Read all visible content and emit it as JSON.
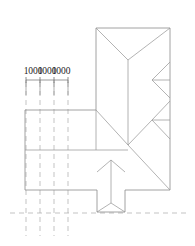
{
  "drawing": {
    "type": "architectural-roof-plan",
    "title": "",
    "background_color": "#ffffff",
    "line_color": "#8c8c8c",
    "dim_line_color": "#6e6e6e",
    "dash_line_color": "#a9a9a9",
    "text_color": "#1c1c1c",
    "canvas": {
      "width": 195,
      "height": 246
    },
    "dimensions": {
      "labels": [
        "1000",
        "1000",
        "1000"
      ],
      "label_positions": [
        {
          "x": 33,
          "y": 74
        },
        {
          "x": 47,
          "y": 74
        },
        {
          "x": 61,
          "y": 74
        }
      ],
      "dim_line": {
        "x1": 26,
        "y1": 80,
        "x2": 68,
        "y2": 80
      },
      "ticks": [
        26,
        40,
        54,
        68
      ],
      "tick_half": 3,
      "extension_lines": [
        {
          "x": 26,
          "y1": 80,
          "y2": 95
        },
        {
          "x": 40,
          "y1": 80,
          "y2": 95
        },
        {
          "x": 54,
          "y1": 80,
          "y2": 95
        },
        {
          "x": 68,
          "y1": 80,
          "y2": 95
        }
      ]
    },
    "grid_lines": {
      "vertical": [
        {
          "x": 26,
          "y1": 82,
          "y2": 236
        },
        {
          "x": 40,
          "y1": 82,
          "y2": 236
        },
        {
          "x": 54,
          "y1": 82,
          "y2": 236
        },
        {
          "x": 68,
          "y1": 82,
          "y2": 236
        }
      ],
      "horizontal": [
        {
          "y": 213,
          "x1": 10,
          "x2": 186
        }
      ]
    },
    "outline": {
      "main_block": {
        "x": 96,
        "y": 28,
        "width": 74,
        "height": 162
      },
      "left_wing": {
        "x": 25,
        "y": 110,
        "width": 71,
        "height": 80
      },
      "dormer": {
        "x": 97,
        "y": 160,
        "width": 28,
        "height": 52
      }
    },
    "roof_lines": {
      "hips": [
        {
          "x1": 96,
          "y1": 28,
          "x2": 128,
          "y2": 60
        },
        {
          "x1": 170,
          "y1": 28,
          "x2": 128,
          "y2": 60
        },
        {
          "x1": 128,
          "y1": 60,
          "x2": 128,
          "y2": 145
        },
        {
          "x1": 96,
          "y1": 110,
          "x2": 128,
          "y2": 145
        },
        {
          "x1": 128,
          "y1": 145,
          "x2": 170,
          "y2": 190
        },
        {
          "x1": 128,
          "y1": 145,
          "x2": 152,
          "y2": 120
        },
        {
          "x1": 152,
          "y1": 120,
          "x2": 170,
          "y2": 101
        },
        {
          "x1": 152,
          "y1": 120,
          "x2": 170,
          "y2": 139
        },
        {
          "x1": 152,
          "y1": 120,
          "x2": 170,
          "y2": 120
        },
        {
          "x1": 170,
          "y1": 62,
          "x2": 152,
          "y2": 80
        },
        {
          "x1": 152,
          "y1": 80,
          "x2": 170,
          "y2": 98
        },
        {
          "x1": 152,
          "y1": 80,
          "x2": 170,
          "y2": 80
        },
        {
          "x1": 96,
          "y1": 150,
          "x2": 128,
          "y2": 150
        },
        {
          "x1": 25,
          "y1": 150,
          "x2": 96,
          "y2": 150
        }
      ],
      "dormer_lines": [
        {
          "x1": 97,
          "y1": 172,
          "x2": 111,
          "y2": 160
        },
        {
          "x1": 125,
          "y1": 172,
          "x2": 111,
          "y2": 160
        },
        {
          "x1": 111,
          "y1": 160,
          "x2": 111,
          "y2": 203
        },
        {
          "x1": 97,
          "y1": 212,
          "x2": 111,
          "y2": 203
        },
        {
          "x1": 125,
          "y1": 212,
          "x2": 111,
          "y2": 203
        }
      ]
    },
    "labels": {
      "dim_1": "1000",
      "dim_2": "1000",
      "dim_3": "1000"
    }
  }
}
